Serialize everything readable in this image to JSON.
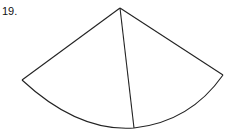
{
  "question": {
    "number": "19.",
    "cutoff_text": ""
  },
  "figure": {
    "stroke_color": "#222222",
    "apex": [
      120,
      8
    ],
    "left_end": [
      22,
      80
    ],
    "right_end": [
      223,
      75
    ],
    "divider_end": [
      134,
      128
    ]
  }
}
